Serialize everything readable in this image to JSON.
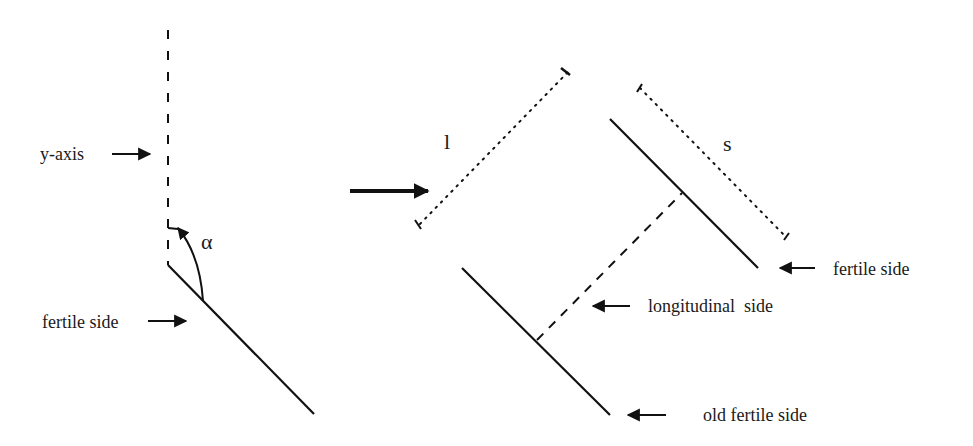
{
  "diagram": {
    "left": {
      "y_axis_label": "y-axis",
      "angle_label": "α",
      "fertile_side_label": "fertile side"
    },
    "transition_arrow": "right-arrow",
    "right": {
      "length_label": "l",
      "spacing_label": "s",
      "fertile_side_label": "fertile side",
      "longitudinal_side_label": "longitudinal  side",
      "old_fertile_side_label": "old fertile side"
    },
    "colors": {
      "ink": "#111111",
      "background": "#ffffff"
    }
  }
}
